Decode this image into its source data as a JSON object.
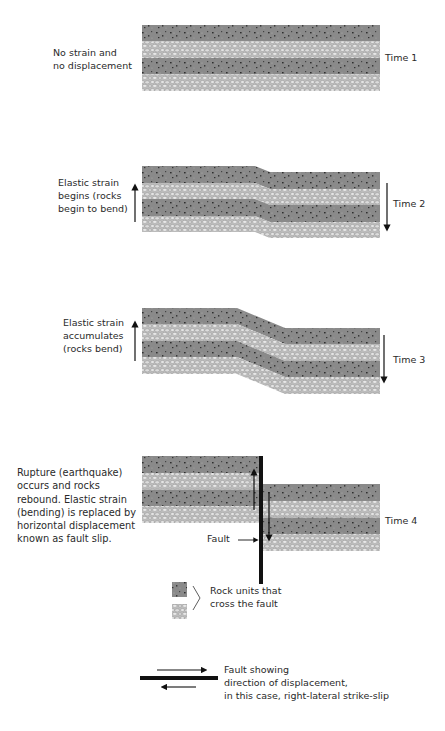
{
  "colors": {
    "dark_rock": "#8a8a8a",
    "light_rock": "#d2d2d2",
    "fault": "#111111",
    "text": "#2a2a2a"
  },
  "stages": [
    {
      "time_label": "Time 1",
      "description_lines": [
        "No strain and",
        "no displacement"
      ]
    },
    {
      "time_label": "Time 2",
      "description_lines": [
        "Elastic strain",
        "begins (rocks",
        "begin to bend)"
      ]
    },
    {
      "time_label": "Time 3",
      "description_lines": [
        "Elastic strain",
        "accumulates",
        "(rocks bend)"
      ]
    },
    {
      "time_label": "Time 4",
      "description_lines": [
        "Rupture (earthquake)",
        "occurs and rocks",
        "rebound. Elastic strain",
        "(bending) is replaced by",
        "horizontal displacement",
        "known as fault slip."
      ],
      "fault_label": "Fault"
    }
  ],
  "legend": {
    "rock_units_lines": [
      "Rock units that",
      "cross the fault"
    ],
    "fault_lines": [
      "Fault showing",
      "direction of displacement,",
      "in this case, right-lateral strike-slip"
    ]
  }
}
